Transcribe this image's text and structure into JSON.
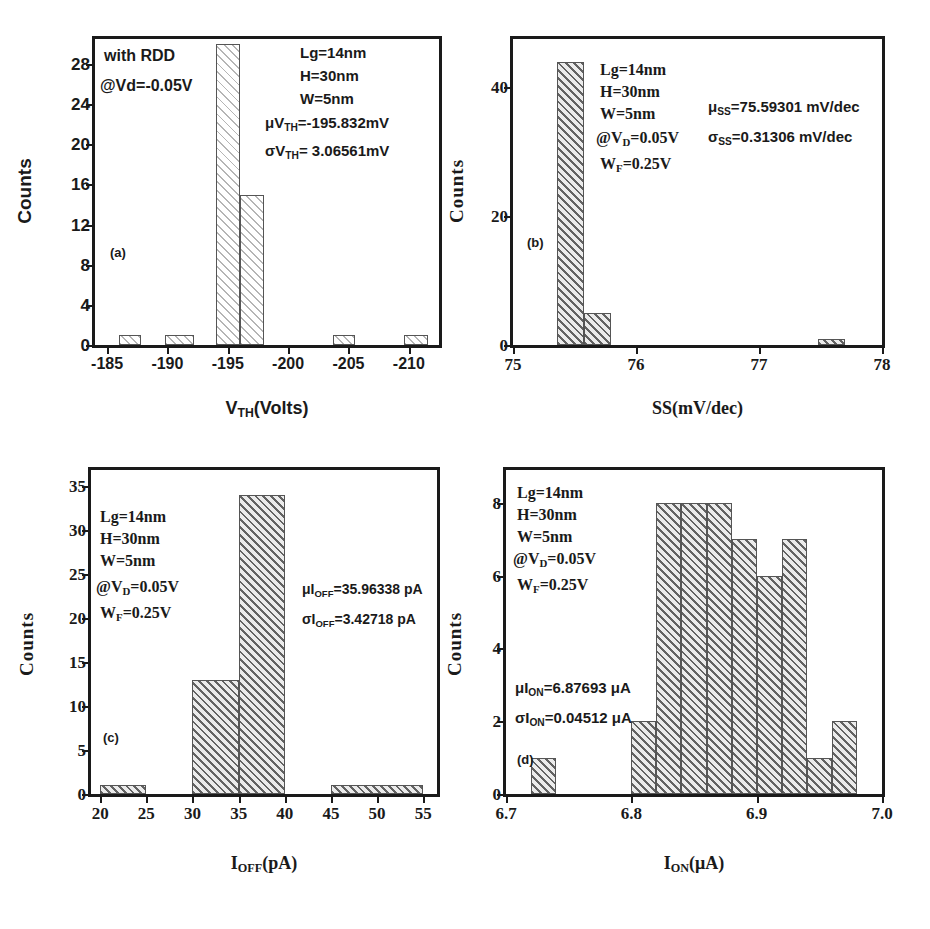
{
  "figure": {
    "background": "#ffffff",
    "bar_edge_color": "#555555",
    "text_color": "#1a1a1a"
  },
  "chart_data": [
    {
      "type": "bar",
      "panel": "(a)",
      "title": "",
      "xlabel": "V_TH(Volts)",
      "xlabel_parts": {
        "pre": "V",
        "sub": "TH",
        "post": "(Volts)"
      },
      "ylabel": "Counts",
      "xlim": [
        -184.0,
        -212.5
      ],
      "ylim": [
        0,
        30.5
      ],
      "x_reversed": true,
      "xticks": [
        -185,
        -190,
        -195,
        -200,
        -205,
        -210
      ],
      "xtick_labels": [
        "-185",
        "-190",
        "-195",
        "-200",
        "-205",
        "-210"
      ],
      "yticks": [
        0,
        4,
        8,
        12,
        16,
        20,
        24,
        28
      ],
      "ytick_labels": [
        "0",
        "4",
        "8",
        "12",
        "16",
        "20",
        "24",
        "28"
      ],
      "grid": false,
      "bin_edges": [
        -186.0,
        -187.8,
        -189.8,
        -192.2,
        -194.0,
        -196.0,
        -198.0,
        -203.7,
        -205.5,
        -209.6,
        -211.6
      ],
      "bins": [
        {
          "left": -186.0,
          "right": -187.8,
          "value": 1
        },
        {
          "left": -189.8,
          "right": -192.2,
          "value": 1
        },
        {
          "left": -194.0,
          "right": -196.0,
          "value": 30
        },
        {
          "left": -196.0,
          "right": -198.0,
          "value": 15
        },
        {
          "left": -203.7,
          "right": -205.5,
          "value": 1
        },
        {
          "left": -209.6,
          "right": -211.6,
          "value": 1
        }
      ],
      "fill": "hatch-light",
      "annotations": [
        {
          "id": "with-rdd",
          "text": "with RDD"
        },
        {
          "id": "bias",
          "text": "@Vd=-0.05V"
        },
        {
          "id": "lg",
          "text": "Lg=14nm"
        },
        {
          "id": "h",
          "text": "H=30nm"
        },
        {
          "id": "w",
          "text": "W=5nm"
        },
        {
          "id": "mu",
          "pre": "μV",
          "sub": "TH",
          "post": "=-195.832mV"
        },
        {
          "id": "sigma",
          "pre": "σV",
          "sub": "TH",
          "post": "= 3.06561mV"
        }
      ]
    },
    {
      "type": "bar",
      "panel": "(b)",
      "title": "",
      "xlabel": "SS(mV/dec)",
      "ylabel": "Counts",
      "xlim": [
        75.0,
        78.0
      ],
      "ylim": [
        0,
        47.5
      ],
      "x_reversed": false,
      "xticks": [
        75,
        76,
        77,
        78
      ],
      "xtick_labels": [
        "75",
        "76",
        "77",
        "78"
      ],
      "yticks": [
        0,
        20,
        40
      ],
      "ytick_labels": [
        "0",
        "20",
        "40"
      ],
      "grid": false,
      "bins": [
        {
          "left": 75.36,
          "right": 75.58,
          "value": 44
        },
        {
          "left": 75.58,
          "right": 75.8,
          "value": 5
        },
        {
          "left": 77.48,
          "right": 77.7,
          "value": 1
        }
      ],
      "fill": "hatch-mid",
      "annotations": [
        {
          "id": "lg",
          "text": "Lg=14nm"
        },
        {
          "id": "h",
          "text": "H=30nm"
        },
        {
          "id": "w",
          "text": "W=5nm"
        },
        {
          "id": "vd",
          "pre": "@V",
          "sub": "D",
          "post": "=0.05V"
        },
        {
          "id": "wf",
          "pre": "W",
          "sub": "F",
          "post": "=0.25V"
        },
        {
          "id": "mu",
          "pre": "μ",
          "sub": "SS",
          "post": "=75.59301 mV/dec"
        },
        {
          "id": "sigma",
          "pre": "σ",
          "sub": "SS",
          "post": "=0.31306 mV/dec"
        }
      ]
    },
    {
      "type": "bar",
      "panel": "(c)",
      "title": "",
      "xlabel": "I_OFF(pA)",
      "xlabel_parts": {
        "pre": "I",
        "sub": "OFF",
        "post": "(pA)"
      },
      "ylabel": "Counts",
      "xlim": [
        19.0,
        56.5
      ],
      "ylim": [
        0,
        36.8
      ],
      "x_reversed": false,
      "xticks": [
        20,
        25,
        30,
        35,
        40,
        45,
        50,
        55
      ],
      "xtick_labels": [
        "20",
        "25",
        "30",
        "35",
        "40",
        "45",
        "50",
        "55"
      ],
      "yticks": [
        0,
        5,
        10,
        15,
        20,
        25,
        30,
        35
      ],
      "ytick_labels": [
        "0",
        "5",
        "10",
        "15",
        "20",
        "25",
        "30",
        "35"
      ],
      "grid": false,
      "bins": [
        {
          "left": 20,
          "right": 25,
          "value": 1
        },
        {
          "left": 30,
          "right": 35,
          "value": 13
        },
        {
          "left": 35,
          "right": 40,
          "value": 34
        },
        {
          "left": 45,
          "right": 55,
          "value": 1
        }
      ],
      "fill": "hatch-mid",
      "annotations": [
        {
          "id": "lg",
          "text": "Lg=14nm"
        },
        {
          "id": "h",
          "text": "H=30nm"
        },
        {
          "id": "w",
          "text": "W=5nm"
        },
        {
          "id": "vd",
          "pre": "@V",
          "sub": "D",
          "post": "=0.05V"
        },
        {
          "id": "wf",
          "pre": "W",
          "sub": "F",
          "post": "=0.25V"
        },
        {
          "id": "mu",
          "pre": "μI",
          "sub": "OFF",
          "post": "=35.96338 pA"
        },
        {
          "id": "sigma",
          "pre": "σI",
          "sub": "OFF",
          "post": "=3.42718 pA"
        }
      ]
    },
    {
      "type": "bar",
      "panel": "(d)",
      "title": "",
      "xlabel": "I_ON(μA)",
      "xlabel_parts": {
        "pre": "I",
        "sub": "ON",
        "post": "(μA)"
      },
      "ylabel": "Counts",
      "xlim": [
        6.7,
        7.0
      ],
      "ylim": [
        0,
        8.9
      ],
      "x_reversed": false,
      "xticks": [
        6.7,
        6.8,
        6.9,
        7.0
      ],
      "xtick_labels": [
        "6.7",
        "6.8",
        "6.9",
        "7.0"
      ],
      "yticks": [
        0,
        2,
        4,
        6,
        8
      ],
      "ytick_labels": [
        "0",
        "2",
        "4",
        "6",
        "8"
      ],
      "grid": false,
      "bins": [
        {
          "left": 6.72,
          "right": 6.74,
          "value": 1
        },
        {
          "left": 6.8,
          "right": 6.82,
          "value": 2
        },
        {
          "left": 6.82,
          "right": 6.84,
          "value": 8
        },
        {
          "left": 6.84,
          "right": 6.86,
          "value": 8
        },
        {
          "left": 6.86,
          "right": 6.88,
          "value": 8
        },
        {
          "left": 6.88,
          "right": 6.9,
          "value": 7
        },
        {
          "left": 6.9,
          "right": 6.92,
          "value": 6
        },
        {
          "left": 6.92,
          "right": 6.94,
          "value": 7
        },
        {
          "left": 6.94,
          "right": 6.96,
          "value": 1
        },
        {
          "left": 6.96,
          "right": 6.98,
          "value": 2
        }
      ],
      "fill": "hatch-mid",
      "annotations": [
        {
          "id": "lg",
          "text": "Lg=14nm"
        },
        {
          "id": "h",
          "text": "H=30nm"
        },
        {
          "id": "w",
          "text": "W=5nm"
        },
        {
          "id": "vd",
          "pre": "@V",
          "sub": "D",
          "post": "=0.05V"
        },
        {
          "id": "wf",
          "pre": "W",
          "sub": "F",
          "post": "=0.25V"
        },
        {
          "id": "mu",
          "pre": "μI",
          "sub": "ON",
          "post": "=6.87693 μA"
        },
        {
          "id": "sigma",
          "pre": "σI",
          "sub": "ON",
          "post": "=0.04512 μA"
        }
      ]
    }
  ]
}
